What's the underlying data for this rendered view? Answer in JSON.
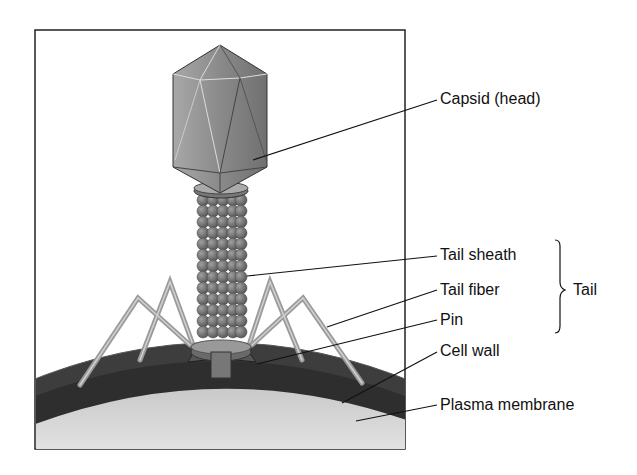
{
  "diagram": {
    "labels": [
      {
        "id": "capsid",
        "text": "Capsid (head)"
      },
      {
        "id": "tail-sheath",
        "text": "Tail sheath"
      },
      {
        "id": "tail-fiber",
        "text": "Tail fiber"
      },
      {
        "id": "pin",
        "text": "Pin"
      },
      {
        "id": "cell-wall",
        "text": "Cell wall"
      },
      {
        "id": "plasma-membrane",
        "text": "Plasma membrane"
      }
    ],
    "group_label": {
      "text": "Tail",
      "members": [
        "Tail sheath",
        "Tail fiber",
        "Pin"
      ]
    }
  }
}
